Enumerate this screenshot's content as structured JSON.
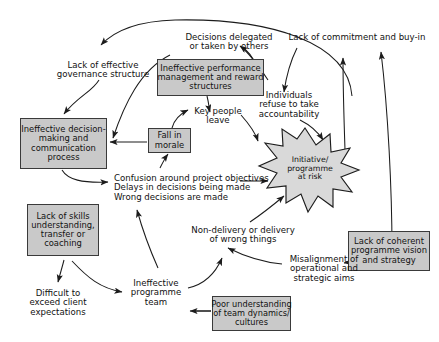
{
  "diagram": {
    "colors": {
      "box_fill": "#c9c9c9",
      "burst_fill": "#d9d9d9",
      "stroke": "#3a3a3a",
      "text": "#111111",
      "background": "#ffffff"
    },
    "nodes": [
      {
        "id": "lack-effective-governance",
        "type": "label",
        "lines": [
          "Lack of effective",
          "governance structure"
        ]
      },
      {
        "id": "decisions-delegated",
        "type": "label",
        "lines": [
          "Decisions delegated",
          "or taken by others"
        ]
      },
      {
        "id": "lack-commitment-buyin",
        "type": "label",
        "lines": [
          "Lack of commitment and buy-in"
        ]
      },
      {
        "id": "ineffective-performance-management",
        "type": "box",
        "lines": [
          "Ineffective performance",
          "management and reward",
          "structures"
        ]
      },
      {
        "id": "key-people-leave",
        "type": "label",
        "lines": [
          "Key people",
          "leave"
        ]
      },
      {
        "id": "individuals-refuse-accountability",
        "type": "label",
        "lines": [
          "Individuals",
          "refuse to take",
          "accountability"
        ]
      },
      {
        "id": "ineffective-decision-making",
        "type": "box",
        "lines": [
          "Ineffective decision-",
          "making and",
          "communication",
          "process"
        ]
      },
      {
        "id": "fall-in-morale",
        "type": "box",
        "lines": [
          "Fall in",
          "morale"
        ]
      },
      {
        "id": "initiative-programme-at-risk",
        "type": "burst",
        "lines": [
          "Initiative/",
          "programme",
          "at risk"
        ]
      },
      {
        "id": "confusion-delays-wrong-decisions",
        "type": "label",
        "lines": [
          "Confusion around project objectives",
          "Delays in decisions being made",
          "Wrong decisions are made"
        ]
      },
      {
        "id": "lack-of-skills",
        "type": "box",
        "lines": [
          "Lack of skills",
          "understanding,",
          "transfer or",
          "coaching"
        ]
      },
      {
        "id": "non-delivery",
        "type": "label",
        "lines": [
          "Non-delivery or delivery",
          "of wrong things"
        ]
      },
      {
        "id": "lack-coherent-vision",
        "type": "box",
        "lines": [
          "Lack of coherent",
          "programme vision",
          "and strategy"
        ]
      },
      {
        "id": "misalignment-aims",
        "type": "label",
        "lines": [
          "Misalignment of",
          "operational and",
          "strategic aims"
        ]
      },
      {
        "id": "difficult-exceed-client",
        "type": "label",
        "lines": [
          "Difficult to",
          "exceed client",
          "expectations"
        ]
      },
      {
        "id": "ineffective-programme-team",
        "type": "label",
        "lines": [
          "Ineffective",
          "programme",
          "team"
        ]
      },
      {
        "id": "poor-understanding-team-dynamics",
        "type": "box",
        "lines": [
          "Poor understanding",
          "of team dynamics/",
          "cultures"
        ]
      }
    ]
  }
}
